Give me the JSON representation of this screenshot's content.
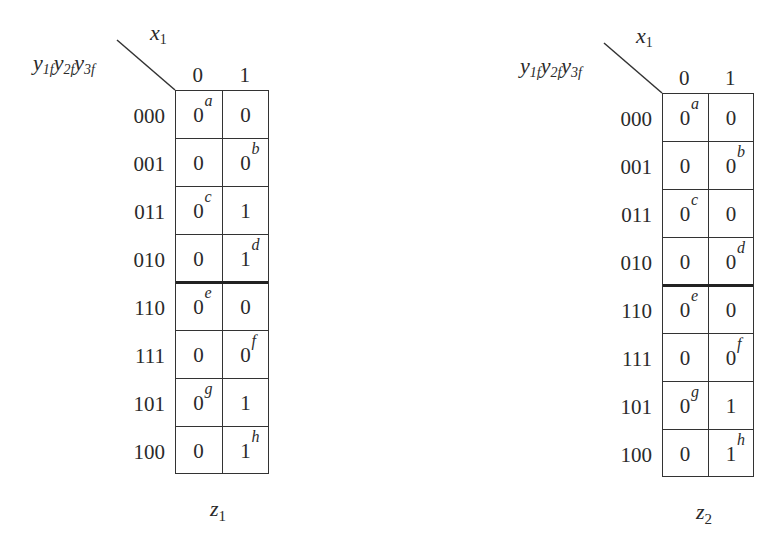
{
  "maps": [
    {
      "id": "z1",
      "function_name": "z",
      "function_sub": "1",
      "column_variable": "x",
      "column_variable_sub": "1",
      "row_variables": [
        {
          "name": "y",
          "sub": "1f"
        },
        {
          "name": "y",
          "sub": "2f"
        },
        {
          "name": "y",
          "sub": "3f"
        }
      ],
      "column_headers": [
        "0",
        "1"
      ],
      "rows": [
        {
          "label": "000",
          "cells": [
            {
              "v": "0",
              "tag": "a"
            },
            {
              "v": "0",
              "tag": ""
            }
          ]
        },
        {
          "label": "001",
          "cells": [
            {
              "v": "0",
              "tag": ""
            },
            {
              "v": "0",
              "tag": "b"
            }
          ]
        },
        {
          "label": "011",
          "cells": [
            {
              "v": "0",
              "tag": "c"
            },
            {
              "v": "1",
              "tag": ""
            }
          ]
        },
        {
          "label": "010",
          "cells": [
            {
              "v": "0",
              "tag": ""
            },
            {
              "v": "1",
              "tag": "d"
            }
          ]
        },
        {
          "label": "110",
          "cells": [
            {
              "v": "0",
              "tag": "e"
            },
            {
              "v": "0",
              "tag": ""
            }
          ]
        },
        {
          "label": "111",
          "cells": [
            {
              "v": "0",
              "tag": ""
            },
            {
              "v": "0",
              "tag": "f"
            }
          ]
        },
        {
          "label": "101",
          "cells": [
            {
              "v": "0",
              "tag": "g"
            },
            {
              "v": "1",
              "tag": ""
            }
          ]
        },
        {
          "label": "100",
          "cells": [
            {
              "v": "0",
              "tag": ""
            },
            {
              "v": "1",
              "tag": "h"
            }
          ]
        }
      ]
    },
    {
      "id": "z2",
      "function_name": "z",
      "function_sub": "2",
      "column_variable": "x",
      "column_variable_sub": "1",
      "row_variables": [
        {
          "name": "y",
          "sub": "1f"
        },
        {
          "name": "y",
          "sub": "2f"
        },
        {
          "name": "y",
          "sub": "3f"
        }
      ],
      "column_headers": [
        "0",
        "1"
      ],
      "rows": [
        {
          "label": "000",
          "cells": [
            {
              "v": "0",
              "tag": "a"
            },
            {
              "v": "0",
              "tag": ""
            }
          ]
        },
        {
          "label": "001",
          "cells": [
            {
              "v": "0",
              "tag": ""
            },
            {
              "v": "0",
              "tag": "b"
            }
          ]
        },
        {
          "label": "011",
          "cells": [
            {
              "v": "0",
              "tag": "c"
            },
            {
              "v": "0",
              "tag": ""
            }
          ]
        },
        {
          "label": "010",
          "cells": [
            {
              "v": "0",
              "tag": ""
            },
            {
              "v": "0",
              "tag": "d"
            }
          ]
        },
        {
          "label": "110",
          "cells": [
            {
              "v": "0",
              "tag": "e"
            },
            {
              "v": "0",
              "tag": ""
            }
          ]
        },
        {
          "label": "111",
          "cells": [
            {
              "v": "0",
              "tag": ""
            },
            {
              "v": "0",
              "tag": "f"
            }
          ]
        },
        {
          "label": "101",
          "cells": [
            {
              "v": "0",
              "tag": "g"
            },
            {
              "v": "1",
              "tag": ""
            }
          ]
        },
        {
          "label": "100",
          "cells": [
            {
              "v": "0",
              "tag": ""
            },
            {
              "v": "1",
              "tag": "h"
            }
          ]
        }
      ]
    }
  ]
}
